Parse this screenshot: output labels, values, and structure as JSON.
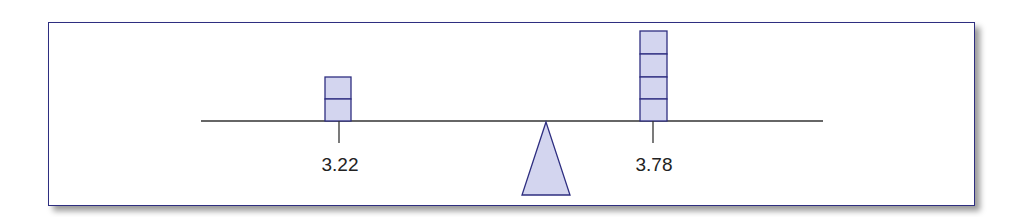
{
  "diagram": {
    "type": "balance-beam",
    "left": {
      "label": "3.22",
      "blocks": 2
    },
    "right": {
      "label": "3.78",
      "blocks": 4
    },
    "colors": {
      "border": "#2e2e80",
      "block_fill": "#d3d5ef",
      "line": "#333333"
    }
  }
}
